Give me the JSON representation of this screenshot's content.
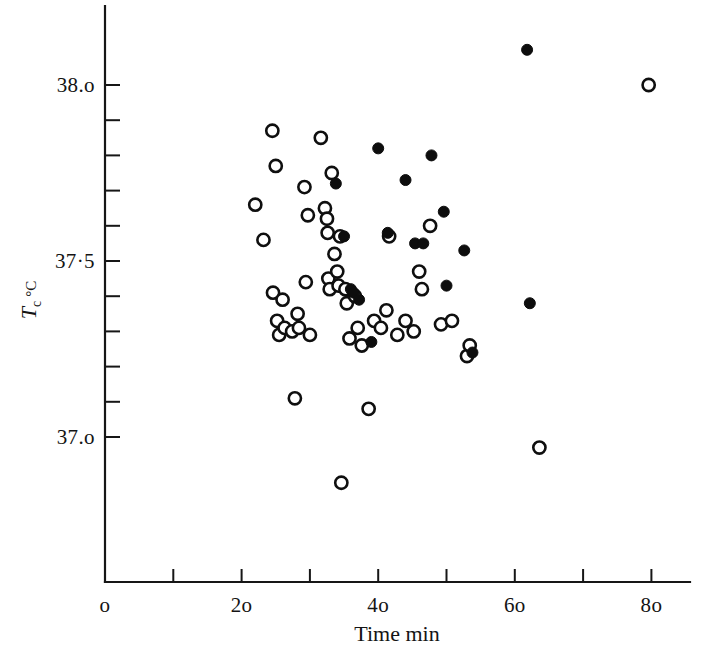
{
  "figure": {
    "background_color": "#ffffff",
    "ink_color": "#141414"
  },
  "chart_data": {
    "type": "scatter",
    "title": "",
    "xlabel": "Time min",
    "ylabel": "Tₑ °C",
    "ylabel_parts": {
      "symbol": "T",
      "subscript": "c",
      "unit": "°C"
    },
    "xlim": [
      0,
      85
    ],
    "ylim": [
      36.72,
      38.18
    ],
    "grid": false,
    "legend": "none",
    "x_ticks": [
      0,
      10,
      20,
      30,
      40,
      50,
      60,
      70,
      80
    ],
    "x_tick_labels": [
      "0",
      "",
      "20",
      "",
      "40",
      "",
      "60",
      "",
      "80"
    ],
    "x_tick_labels_shown": [
      "0",
      "20",
      "40",
      "60",
      "80"
    ],
    "y_ticks": [
      37.0,
      37.1,
      37.2,
      37.3,
      37.4,
      37.5,
      37.6,
      37.7,
      37.8,
      37.9,
      38.0
    ],
    "y_tick_labels_shown": [
      "37.0",
      "37·5",
      "38.0"
    ],
    "y_labeled_ticks": [
      37.0,
      37.5,
      38.0
    ],
    "marker_size_px": 9,
    "series": [
      {
        "name": "open-circles",
        "marker": "open circle",
        "fill": "#ffffff",
        "edge": "#0f0f0f",
        "count": 52,
        "points": [
          [
            22.0,
            37.66
          ],
          [
            23.2,
            37.56
          ],
          [
            24.5,
            37.87
          ],
          [
            24.6,
            37.41
          ],
          [
            25.0,
            37.77
          ],
          [
            25.2,
            37.33
          ],
          [
            25.5,
            37.29
          ],
          [
            26.0,
            37.39
          ],
          [
            26.3,
            37.31
          ],
          [
            27.4,
            37.3
          ],
          [
            27.8,
            37.11
          ],
          [
            28.2,
            37.35
          ],
          [
            28.4,
            37.31
          ],
          [
            29.2,
            37.71
          ],
          [
            29.4,
            37.44
          ],
          [
            29.7,
            37.63
          ],
          [
            30.0,
            37.29
          ],
          [
            31.6,
            37.85
          ],
          [
            32.2,
            37.65
          ],
          [
            32.5,
            37.62
          ],
          [
            32.6,
            37.58
          ],
          [
            32.7,
            37.45
          ],
          [
            32.9,
            37.42
          ],
          [
            33.2,
            37.75
          ],
          [
            33.6,
            37.52
          ],
          [
            34.0,
            37.47
          ],
          [
            34.2,
            37.43
          ],
          [
            34.4,
            37.57
          ],
          [
            34.6,
            36.87
          ],
          [
            35.2,
            37.42
          ],
          [
            35.4,
            37.38
          ],
          [
            35.8,
            37.28
          ],
          [
            36.6,
            37.4
          ],
          [
            37.0,
            37.31
          ],
          [
            37.6,
            37.26
          ],
          [
            38.6,
            37.08
          ],
          [
            39.4,
            37.33
          ],
          [
            40.4,
            37.31
          ],
          [
            41.2,
            37.36
          ],
          [
            41.6,
            37.57
          ],
          [
            42.8,
            37.29
          ],
          [
            44.0,
            37.33
          ],
          [
            45.2,
            37.3
          ],
          [
            46.0,
            37.47
          ],
          [
            46.4,
            37.42
          ],
          [
            47.6,
            37.6
          ],
          [
            49.2,
            37.32
          ],
          [
            50.8,
            37.33
          ],
          [
            53.0,
            37.23
          ],
          [
            53.4,
            37.26
          ],
          [
            63.6,
            36.97
          ],
          [
            79.6,
            38.0
          ]
        ]
      },
      {
        "name": "filled-circles",
        "marker": "filled circle",
        "fill": "#0d0d0d",
        "edge": "#0d0d0d",
        "count": 18,
        "points": [
          [
            33.8,
            37.72
          ],
          [
            35.0,
            37.57
          ],
          [
            36.0,
            37.42
          ],
          [
            36.4,
            37.41
          ],
          [
            37.2,
            37.39
          ],
          [
            39.0,
            37.27
          ],
          [
            40.0,
            37.82
          ],
          [
            41.4,
            37.58
          ],
          [
            44.0,
            37.73
          ],
          [
            45.4,
            37.55
          ],
          [
            46.6,
            37.55
          ],
          [
            47.8,
            37.8
          ],
          [
            49.6,
            37.64
          ],
          [
            50.0,
            37.43
          ],
          [
            52.6,
            37.53
          ],
          [
            53.8,
            37.24
          ],
          [
            61.8,
            38.1
          ],
          [
            62.2,
            37.38
          ]
        ]
      }
    ]
  },
  "axes": {
    "x_axis_name": "time-axis",
    "y_axis_name": "temperature-axis"
  }
}
